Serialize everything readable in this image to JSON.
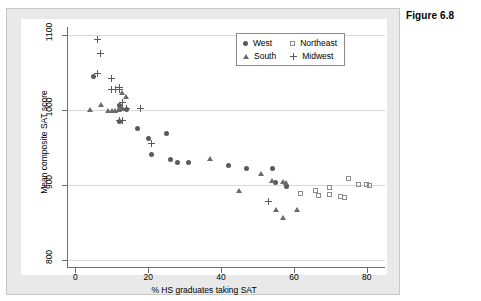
{
  "figure": {
    "caption": "Figure 6.8"
  },
  "chart_data": {
    "type": "scatter",
    "title": "",
    "xlabel": "% HS graduates taking SAT",
    "ylabel": "Mean composite SAT score",
    "xlim": [
      -2,
      85
    ],
    "ylim": [
      790,
      1110
    ],
    "xticks": [
      0,
      20,
      40,
      60,
      80
    ],
    "yticks": [
      800,
      900,
      1000,
      1100
    ],
    "grid": "horizontal",
    "legend_position": "top-right",
    "series": [
      {
        "name": "West",
        "marker": "filled-circle",
        "color": "#5a5a5a",
        "points": [
          [
            5,
            1044
          ],
          [
            14,
            1000
          ],
          [
            17,
            975
          ],
          [
            20,
            962
          ],
          [
            21,
            940
          ],
          [
            25,
            968
          ],
          [
            26,
            934
          ],
          [
            28,
            930
          ],
          [
            42,
            925
          ],
          [
            47,
            921
          ],
          [
            54,
            922
          ],
          [
            55,
            903
          ],
          [
            58,
            897
          ],
          [
            12,
            984
          ],
          [
            12,
            1005
          ],
          [
            31,
            929
          ]
        ]
      },
      {
        "name": "Northeast",
        "marker": "open-square",
        "color": "#8c8c8c",
        "points": [
          [
            62,
            888
          ],
          [
            66,
            891
          ],
          [
            67,
            885
          ],
          [
            70,
            895
          ],
          [
            70,
            886
          ],
          [
            73,
            884
          ],
          [
            74,
            882
          ],
          [
            75,
            908
          ],
          [
            78,
            899
          ],
          [
            80,
            899
          ],
          [
            81,
            898
          ]
        ]
      },
      {
        "name": "South",
        "marker": "filled-triangle",
        "color": "#6a6a6a",
        "points": [
          [
            4,
            999
          ],
          [
            7,
            1005
          ],
          [
            9,
            998
          ],
          [
            10,
            997
          ],
          [
            11,
            998
          ],
          [
            12,
            999
          ],
          [
            12,
            1000
          ],
          [
            13,
            1000
          ],
          [
            13,
            1002
          ],
          [
            13,
            1021
          ],
          [
            14,
            1016
          ],
          [
            37,
            933
          ],
          [
            45,
            891
          ],
          [
            54,
            904
          ],
          [
            57,
            903
          ],
          [
            58,
            902
          ],
          [
            55,
            866
          ],
          [
            57,
            855
          ],
          [
            61,
            866
          ],
          [
            51,
            913
          ]
        ]
      },
      {
        "name": "Midwest",
        "marker": "plus",
        "color": "#5a5a5a",
        "points": [
          [
            6,
            1093
          ],
          [
            7,
            1075
          ],
          [
            6,
            1048
          ],
          [
            10,
            1042
          ],
          [
            10,
            1027
          ],
          [
            11,
            1027
          ],
          [
            12,
            1027
          ],
          [
            12,
            1029
          ],
          [
            13,
            1010
          ],
          [
            14,
            1001
          ],
          [
            18,
            1001
          ],
          [
            12,
            985
          ],
          [
            13,
            986
          ],
          [
            21,
            955
          ],
          [
            53,
            878
          ]
        ]
      }
    ]
  },
  "legend": {
    "entries": [
      {
        "label": "West",
        "marker": "filled-circle"
      },
      {
        "label": "Northeast",
        "marker": "open-square"
      },
      {
        "label": "South",
        "marker": "filled-triangle"
      },
      {
        "label": "Midwest",
        "marker": "plus"
      }
    ]
  },
  "colors": {
    "panel_background": "#e9e9e9",
    "plot_background": "#ffffff",
    "axis": "#6e6e6e",
    "gridline": "#d8d8d8",
    "marker_dark": "#5a5a5a",
    "marker_open": "#8c8c8c"
  }
}
